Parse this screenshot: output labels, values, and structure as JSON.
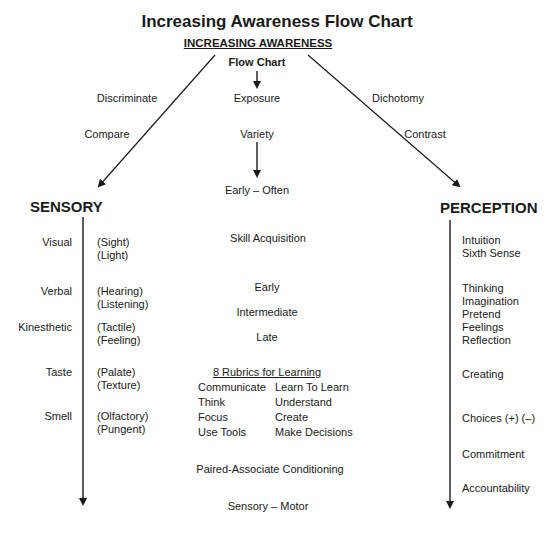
{
  "title": "Increasing Awareness Flow Chart",
  "header": {
    "subtitle": "INCREASING AWARENESS",
    "flow_label": "Flow Chart"
  },
  "left_branch": {
    "labels": [
      "Discriminate",
      "Compare"
    ],
    "heading": "SENSORY",
    "senses": [
      {
        "name": "Visual",
        "details": [
          "(Sight)",
          "(Light)"
        ]
      },
      {
        "name": "Verbal",
        "details": [
          "(Hearing)",
          "(Listening)"
        ]
      },
      {
        "name": "Kinesthetic",
        "details": [
          "(Tactile)",
          "(Feeling)"
        ]
      },
      {
        "name": "Taste",
        "details": [
          "(Palate)",
          "(Texture)"
        ]
      },
      {
        "name": "Smell",
        "details": [
          "(Olfactory)",
          "(Pungent)"
        ]
      }
    ]
  },
  "center": {
    "exposure": "Exposure",
    "variety": "Variety",
    "early_often": "Early – Often",
    "skill_acquisition": "Skill Acquisition",
    "stages": [
      "Early",
      "Intermediate",
      "Late"
    ],
    "rubrics_title": "8 Rubrics for Learning",
    "rubrics": [
      [
        "Communicate",
        "Learn To Learn"
      ],
      [
        "Think",
        "Understand"
      ],
      [
        "Focus",
        "Create"
      ],
      [
        "Use Tools",
        "Make Decisions"
      ]
    ],
    "conditioning": "Paired-Associate Conditioning",
    "sensory_motor": "Sensory – Motor"
  },
  "right_branch": {
    "labels": [
      "Dichotomy",
      "Contrast"
    ],
    "heading": "PERCEPTION",
    "groups": [
      [
        "Intuition",
        "Sixth Sense"
      ],
      [
        "Thinking",
        "Imagination",
        "Pretend",
        "Feelings",
        "Reflection"
      ],
      [
        "Creating"
      ],
      [
        "Choices (+) (–)"
      ],
      [
        "Commitment"
      ],
      [
        "Accountability"
      ]
    ]
  },
  "colors": {
    "ink": "#1a1a1a",
    "background": "#ffffff"
  }
}
